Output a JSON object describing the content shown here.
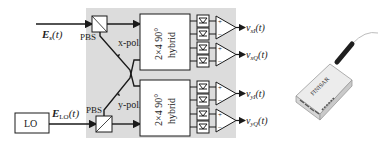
{
  "diagram": {
    "inputs": {
      "signal": "E",
      "signal_sub": "s",
      "signal_arg": "(t)",
      "lo_field": "E",
      "lo_field_sub": "LO",
      "lo_field_arg": "(t)"
    },
    "lo_box": "LO",
    "pbs_top": "PBS",
    "pbs_bottom": "PBS",
    "x_pol": "x-pol.",
    "y_pol": "y-pol.",
    "hybrid_top": [
      "2×4 90°",
      "hybrid"
    ],
    "hybrid_bottom": [
      "2×4 90°",
      "hybrid"
    ],
    "amp_plus": "+",
    "amp_minus": "−",
    "outputs": [
      {
        "v": "v",
        "sub": "xI",
        "arg": "(t)"
      },
      {
        "v": "v",
        "sub": "xQ",
        "arg": "(t)"
      },
      {
        "v": "v",
        "sub": "yI",
        "arg": "(t)"
      },
      {
        "v": "v",
        "sub": "yQ",
        "arg": "(t)"
      }
    ],
    "device_photo": "Integrated coherent receiver module (photo)",
    "device_label": "FINISAR",
    "colors": {
      "panel": "#dcdcdc",
      "line": "#1a1a1a",
      "box_fill": "#ffffff"
    }
  }
}
